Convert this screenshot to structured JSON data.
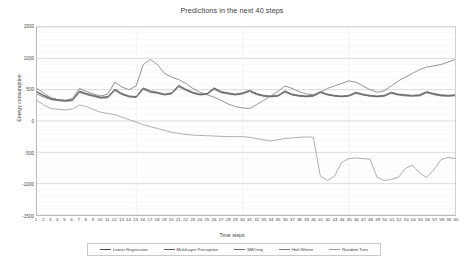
{
  "chart_data": {
    "type": "line",
    "title": "Predictions in the next 40 steps",
    "xlabel": "Time steps",
    "ylabel": "Energy consumption",
    "xlim": [
      1,
      60
    ],
    "ylim": [
      -1500,
      1500
    ],
    "yticks": [
      1500,
      1000,
      500,
      0,
      -500,
      -1000,
      -1500
    ],
    "grid": true,
    "legend_position": "bottom",
    "x": [
      1,
      2,
      3,
      4,
      5,
      6,
      7,
      8,
      9,
      10,
      11,
      12,
      13,
      14,
      15,
      16,
      17,
      18,
      19,
      20,
      21,
      22,
      23,
      24,
      25,
      26,
      27,
      28,
      29,
      30,
      31,
      32,
      33,
      34,
      35,
      36,
      37,
      38,
      39,
      40,
      41,
      42,
      43,
      44,
      45,
      46,
      47,
      48,
      49,
      50,
      51,
      52,
      53,
      54,
      55,
      56,
      57,
      58,
      59,
      60
    ],
    "series": [
      {
        "name": "Linear Regression",
        "color": "#4a4a4a",
        "values": [
          460,
          400,
          350,
          330,
          320,
          330,
          470,
          430,
          400,
          370,
          380,
          500,
          430,
          390,
          380,
          520,
          470,
          450,
          420,
          440,
          560,
          500,
          450,
          420,
          430,
          520,
          460,
          440,
          420,
          440,
          480,
          430,
          400,
          390,
          400,
          470,
          420,
          400,
          390,
          400,
          460,
          420,
          400,
          390,
          400,
          450,
          420,
          400,
          390,
          400,
          450,
          420,
          410,
          400,
          410,
          460,
          430,
          410,
          400,
          410
        ]
      },
      {
        "name": "MultiLayer Perception",
        "color": "#5a5a5a",
        "values": [
          470,
          410,
          360,
          340,
          330,
          340,
          480,
          440,
          410,
          380,
          390,
          510,
          440,
          400,
          390,
          530,
          480,
          460,
          430,
          450,
          570,
          510,
          460,
          430,
          440,
          530,
          470,
          450,
          430,
          450,
          490,
          440,
          410,
          400,
          410,
          480,
          430,
          410,
          400,
          410,
          470,
          430,
          410,
          400,
          410,
          460,
          430,
          410,
          400,
          410,
          460,
          430,
          420,
          410,
          420,
          470,
          440,
          420,
          410,
          420
        ]
      },
      {
        "name": "SMOreg",
        "color": "#6b6b6b",
        "values": [
          430,
          380,
          340,
          325,
          315,
          325,
          455,
          420,
          390,
          365,
          370,
          485,
          420,
          385,
          375,
          505,
          455,
          440,
          415,
          430,
          545,
          490,
          440,
          415,
          425,
          505,
          450,
          430,
          415,
          430,
          470,
          420,
          395,
          385,
          395,
          460,
          415,
          395,
          385,
          395,
          450,
          415,
          395,
          385,
          395,
          440,
          415,
          395,
          385,
          395,
          440,
          415,
          400,
          395,
          400,
          450,
          420,
          400,
          395,
          400
        ]
      },
      {
        "name": "Holt-Winter",
        "color": "#787878",
        "values": [
          520,
          440,
          370,
          340,
          330,
          360,
          520,
          470,
          430,
          400,
          430,
          620,
          540,
          500,
          560,
          900,
          980,
          900,
          760,
          700,
          660,
          600,
          520,
          460,
          420,
          380,
          330,
          270,
          230,
          210,
          200,
          260,
          330,
          400,
          470,
          560,
          520,
          470,
          430,
          420,
          460,
          520,
          560,
          600,
          640,
          620,
          560,
          500,
          460,
          480,
          560,
          640,
          700,
          760,
          820,
          860,
          880,
          900,
          940,
          980
        ]
      },
      {
        "name": "Random Tree",
        "color": "#9a9a9a",
        "values": [
          330,
          250,
          200,
          185,
          175,
          190,
          255,
          230,
          180,
          140,
          120,
          100,
          60,
          20,
          -20,
          -60,
          -90,
          -120,
          -150,
          -180,
          -200,
          -215,
          -225,
          -230,
          -235,
          -240,
          -245,
          -250,
          -250,
          -250,
          -260,
          -280,
          -300,
          -320,
          -300,
          -280,
          -270,
          -260,
          -255,
          -260,
          -880,
          -950,
          -880,
          -660,
          -600,
          -590,
          -600,
          -610,
          -900,
          -950,
          -930,
          -900,
          -760,
          -700,
          -830,
          -900,
          -780,
          -620,
          -580,
          -600
        ]
      }
    ]
  }
}
